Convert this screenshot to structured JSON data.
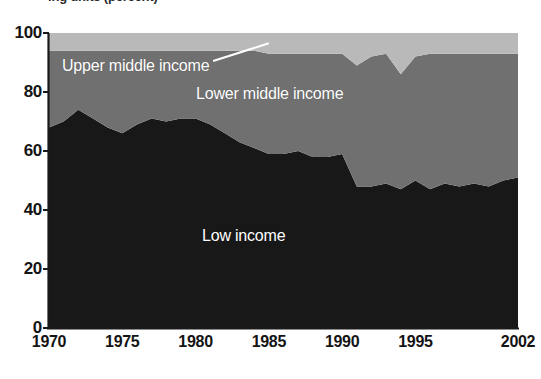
{
  "caption": "ing units (percent)",
  "chart_data": {
    "type": "area",
    "stacked": true,
    "title": "ing units (percent)",
    "xlabel": "",
    "ylabel": "",
    "ylim": [
      0,
      100
    ],
    "xlim": [
      1970,
      2002
    ],
    "grid": false,
    "legend_position": "inline-annotations",
    "x_tick_labels": [
      "1970",
      "1975",
      "1980",
      "1985",
      "1990",
      "1995",
      "2002"
    ],
    "x_ticks": [
      1970,
      1975,
      1980,
      1985,
      1990,
      1995,
      2002
    ],
    "y_tick_labels": [
      "0",
      "20",
      "40",
      "60",
      "80",
      "100"
    ],
    "y_ticks": [
      0,
      20,
      40,
      60,
      80,
      100
    ],
    "x": [
      1970,
      1971,
      1972,
      1973,
      1974,
      1975,
      1976,
      1977,
      1978,
      1979,
      1980,
      1981,
      1982,
      1983,
      1984,
      1985,
      1986,
      1987,
      1988,
      1989,
      1990,
      1991,
      1992,
      1993,
      1994,
      1995,
      1996,
      1997,
      1998,
      1999,
      2000,
      2001,
      2002
    ],
    "series": [
      {
        "name": "Low income",
        "color": "#181818",
        "label_color": "#ffffff",
        "values": [
          68,
          70,
          74,
          71,
          68,
          66,
          69,
          71,
          70,
          71,
          71,
          69,
          66,
          63,
          61,
          59,
          59,
          60,
          58,
          58,
          59,
          48,
          48,
          49,
          47,
          50,
          47,
          49,
          48,
          49,
          48,
          50,
          51
        ]
      },
      {
        "name": "Lower middle income",
        "color": "#707070",
        "label_color": "#ffffff",
        "values": [
          26,
          24,
          20,
          23,
          26,
          28,
          25,
          23,
          24,
          23,
          23,
          25,
          28,
          31,
          33,
          34,
          34,
          33,
          35,
          35,
          34,
          41,
          44,
          44,
          39,
          42,
          46,
          44,
          45,
          44,
          45,
          43,
          42
        ]
      },
      {
        "name": "Upper middle income",
        "color": "#b9b9b9",
        "label_color": "#ffffff",
        "values": [
          6,
          6,
          6,
          6,
          6,
          6,
          6,
          6,
          6,
          6,
          6,
          6,
          6,
          6,
          6,
          7,
          7,
          7,
          7,
          7,
          7,
          11,
          8,
          7,
          14,
          8,
          7,
          7,
          7,
          7,
          7,
          7,
          7
        ]
      }
    ],
    "annotations": [
      {
        "name": "upper-middle-callout",
        "text": "Upper middle income",
        "leader_line": {
          "x1": 1981.2,
          "y1": 90.5,
          "x2": 1985.0,
          "y2": 96.5
        }
      }
    ]
  },
  "axis": {
    "y_label_values": [
      "100",
      "80",
      "60",
      "40",
      "20",
      "0"
    ],
    "x_label_values": [
      "1970",
      "1975",
      "1980",
      "1985",
      "1990",
      "1995",
      "2002"
    ]
  },
  "labels": {
    "upper_middle": "Upper middle income",
    "lower_middle": "Lower middle income",
    "low": "Low income"
  },
  "colors": {
    "low_income": "#181818",
    "lower_middle_income": "#707070",
    "upper_middle_income": "#b9b9b9",
    "axis": "#1a1a1a",
    "background": "#ffffff"
  }
}
